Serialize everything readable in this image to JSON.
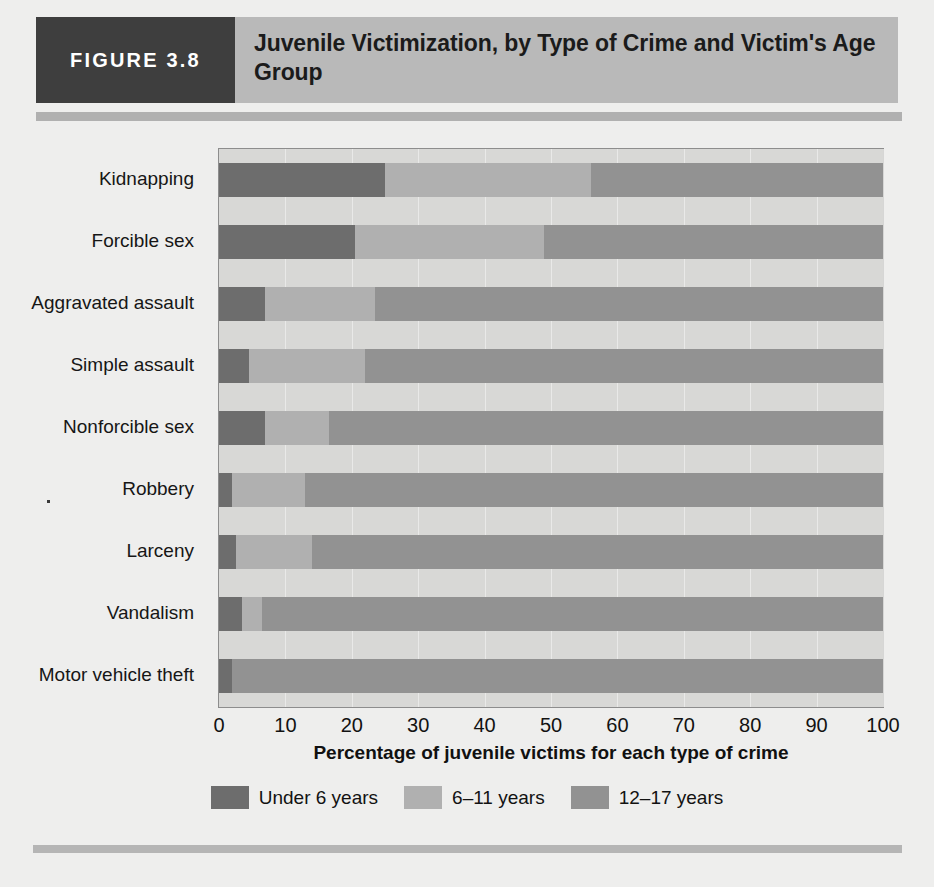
{
  "figure": {
    "tag": "FIGURE 3.8",
    "title": "Juvenile Victimization, by Type of Crime and Victim's Age Group"
  },
  "colors": {
    "under6": "#6d6d6d",
    "age6_11": "#b0b0b0",
    "age12_17": "#929292",
    "plot_background": "#d8d8d6",
    "header_band": "#b9b9b9",
    "tag_background": "#3e3e3e",
    "page_background": "#eeeeed",
    "rule": "#b0b0b0"
  },
  "chart_data": {
    "type": "bar",
    "orientation": "horizontal",
    "stacked": true,
    "title": "Juvenile Victimization, by Type of Crime and Victim's Age Group",
    "xlabel": "Percentage of juvenile victims for each type of crime",
    "ylabel": "",
    "xlim": [
      0,
      100
    ],
    "xticks": [
      0,
      10,
      20,
      30,
      40,
      50,
      60,
      70,
      80,
      90,
      100
    ],
    "grid": true,
    "legend_position": "bottom",
    "categories": [
      "Kidnapping",
      "Forcible sex",
      "Aggravated assault",
      "Simple assault",
      "Nonforcible sex",
      "Robbery",
      "Larceny",
      "Vandalism",
      "Motor vehicle theft"
    ],
    "series": [
      {
        "name": "Under 6 years",
        "color": "#6d6d6d",
        "values": [
          25,
          20.5,
          7,
          4.5,
          7,
          2,
          2.5,
          3.5,
          2
        ]
      },
      {
        "name": "6–11 years",
        "color": "#b0b0b0",
        "values": [
          31,
          28.5,
          16.5,
          17.5,
          9.5,
          11,
          11.5,
          3,
          0
        ]
      },
      {
        "name": "12–17 years",
        "color": "#929292",
        "values": [
          44,
          51,
          76.5,
          78,
          83.5,
          87,
          86,
          93.5,
          98
        ]
      }
    ]
  }
}
